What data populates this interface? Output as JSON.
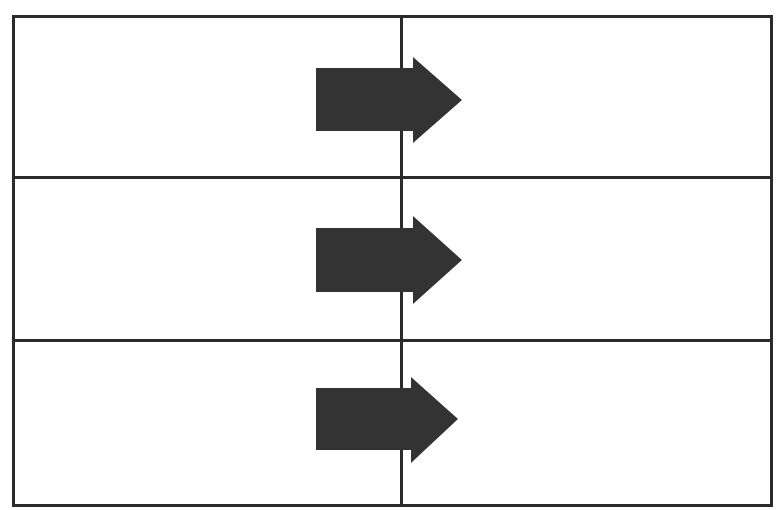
{
  "diagram": {
    "background_color": "#ffffff",
    "border_color": "#2b2b2b",
    "arrow_color": "#333333",
    "border_width_px": 3
  },
  "table": {
    "name": "arrow-grid-table",
    "row_count": 3,
    "column_count": 2,
    "columns": [
      {
        "id": "left",
        "label": "",
        "width_px": 385
      },
      {
        "id": "right",
        "label": "",
        "width_px": 367
      }
    ],
    "rows": [
      {
        "id": "row-1",
        "height_px": 158,
        "cells": [
          {
            "id": "r1c1",
            "text": ""
          },
          {
            "id": "r1c2",
            "text": ""
          }
        ]
      },
      {
        "id": "row-2",
        "height_px": 160,
        "cells": [
          {
            "id": "r2c1",
            "text": ""
          },
          {
            "id": "r2c2",
            "text": ""
          }
        ]
      },
      {
        "id": "row-3",
        "height_px": 162,
        "cells": [
          {
            "id": "r3c1",
            "text": ""
          },
          {
            "id": "r3c2",
            "text": ""
          }
        ]
      }
    ]
  },
  "arrows": [
    {
      "id": "arrow-row-1",
      "label": "",
      "direction": "right",
      "color": "#333333",
      "row": 1,
      "x_px": 314,
      "y_px": 55,
      "width_px": 150,
      "height_px": 90
    },
    {
      "id": "arrow-row-2",
      "label": "",
      "direction": "right",
      "color": "#333333",
      "row": 2,
      "x_px": 314,
      "y_px": 214,
      "width_px": 150,
      "height_px": 92
    },
    {
      "id": "arrow-row-3",
      "label": "",
      "direction": "right",
      "color": "#333333",
      "row": 3,
      "x_px": 314,
      "y_px": 375,
      "width_px": 146,
      "height_px": 90
    }
  ]
}
